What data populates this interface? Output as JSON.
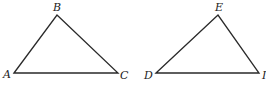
{
  "diagram": {
    "type": "geometry-triangles",
    "colors": {
      "line": "#2a2a2a",
      "label": "#222222",
      "background": "#ffffff"
    },
    "triangles": [
      {
        "name": "ABC",
        "vertices": [
          {
            "label": "A",
            "x": 14,
            "y": 73,
            "lx": 3,
            "ly": 78
          },
          {
            "label": "B",
            "x": 57,
            "y": 15,
            "lx": 53,
            "ly": 11
          },
          {
            "label": "C",
            "x": 118,
            "y": 73,
            "lx": 120,
            "ly": 79
          }
        ]
      },
      {
        "name": "DEI",
        "vertices": [
          {
            "label": "D",
            "x": 156,
            "y": 73,
            "lx": 144,
            "ly": 79
          },
          {
            "label": "E",
            "x": 218,
            "y": 15,
            "lx": 215,
            "ly": 11
          },
          {
            "label": "I",
            "x": 259,
            "y": 73,
            "lx": 262,
            "ly": 79
          }
        ]
      }
    ]
  }
}
